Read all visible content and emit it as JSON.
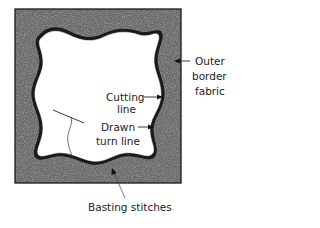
{
  "diagram": {
    "colors": {
      "fabric": "#5a5a5a",
      "fabric_light": "#9a9a9a",
      "outline": "#1a1a1a",
      "background": "#ffffff",
      "label": "#222222"
    },
    "labels": {
      "outer_border": [
        "Outer",
        "border",
        "fabric"
      ],
      "cutting_line": [
        "Cutting",
        "line"
      ],
      "drawn_turn_line": [
        "Drawn",
        "turn line"
      ],
      "basting_stitches": "Basting stitches"
    }
  }
}
